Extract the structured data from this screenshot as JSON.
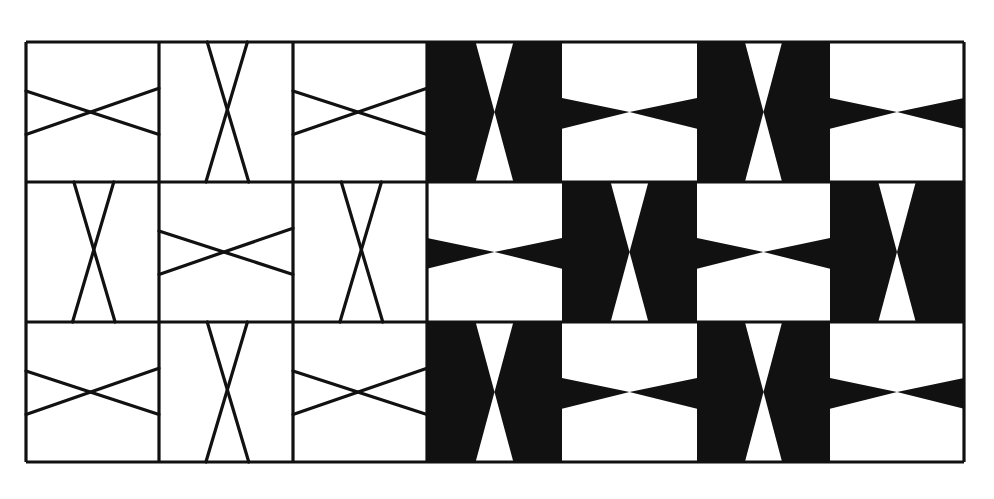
{
  "figure": {
    "background": "#ffffff",
    "ink": "#111111",
    "grid": {
      "rows": 3,
      "cols": 7,
      "col_edges": [
        26,
        159,
        293,
        427,
        562,
        697,
        830,
        964
      ],
      "row_edges": [
        42,
        182,
        322,
        462
      ]
    },
    "outline_tiles": [
      [
        "H",
        "V",
        "H"
      ],
      [
        "V",
        "H",
        "V"
      ],
      [
        "H",
        "V",
        "H"
      ]
    ],
    "filled_tiles": [
      [
        "V",
        "H",
        "V",
        "H"
      ],
      [
        "H",
        "V",
        "H",
        "V"
      ],
      [
        "V",
        "H",
        "V",
        "H"
      ]
    ]
  }
}
